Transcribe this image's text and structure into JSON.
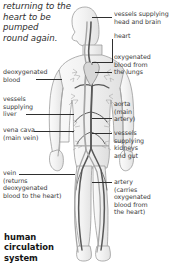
{
  "diagram": {
    "title": "human\ncirculation\nsystem",
    "caption": "returning to the\nheart to be\npumped\nround again.",
    "colors": {
      "background": "#ffffff",
      "text": "#3a3a3a",
      "title_text": "#141414",
      "leader_line": "#2f2f2f",
      "artery": "#6e6e6e",
      "vein": "#9a9a9a",
      "body_outline": "#8c8c8c"
    },
    "labels_right": [
      {
        "id": "vessels-head-brain",
        "text": "vessels supplying\nhead and brain"
      },
      {
        "id": "heart",
        "text": "heart"
      },
      {
        "id": "oxygenated-blood-lungs",
        "text": "oxygenated\nblood from\nthe lungs"
      },
      {
        "id": "aorta",
        "text": "aorta\n(main\nartery)"
      },
      {
        "id": "vessels-kidneys-gut",
        "text": "vessels\nsupplying\nkidneys\nand gut"
      },
      {
        "id": "artery",
        "text": "artery\n(carries\noxygenated\nblood from\nthe heart)"
      }
    ],
    "labels_left": [
      {
        "id": "deoxygenated-blood",
        "text": "deoxygenated\nblood"
      },
      {
        "id": "vessels-liver",
        "text": "vessels\nsupplying\nliver"
      },
      {
        "id": "vena-cava",
        "text": "vena cava\n(main vein)"
      },
      {
        "id": "vein",
        "text": "vein\n(returns\ndeoxygenated\nblood to the heart)"
      }
    ]
  }
}
